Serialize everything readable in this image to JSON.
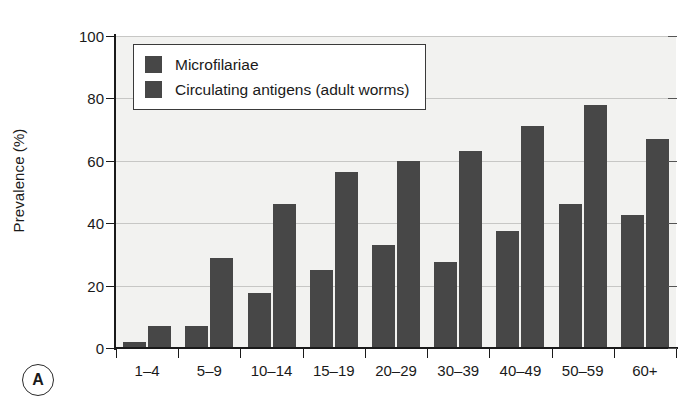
{
  "chart_data": {
    "type": "bar",
    "title": "",
    "subtitle": "",
    "panel_label": "A",
    "xlabel": "",
    "ylabel": "Prevalence (%)",
    "ylim": [
      0,
      100
    ],
    "yticks": [
      0,
      20,
      40,
      60,
      80,
      100
    ],
    "grid": true,
    "legend_position": "top-left inside plot",
    "categories": [
      "1–4",
      "5–9",
      "10–14",
      "15–19",
      "20–29",
      "30–39",
      "40–49",
      "50–59",
      "60+"
    ],
    "series": [
      {
        "name": "Microfilariae",
        "color": "#474747",
        "values": [
          2,
          7,
          17.5,
          25,
          33,
          27.5,
          37.5,
          46,
          42.5
        ]
      },
      {
        "name": "Circulating antigens (adult worms)",
        "color": "#474747",
        "values": [
          7,
          29,
          46,
          56.5,
          60,
          63,
          71,
          78,
          67
        ]
      }
    ]
  },
  "colors": {
    "bar": "#474747",
    "plot_background": "#f2f2f0",
    "gridline": "#c7c7c5",
    "axis": "#1a1a1a",
    "page_background": "#ffffff"
  }
}
